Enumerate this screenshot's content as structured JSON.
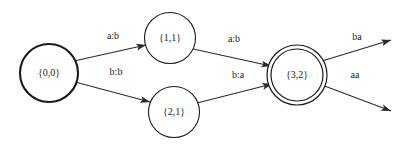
{
  "diagram": {
    "type": "finite-state-transducer",
    "title": "",
    "background_color": "#ffffff",
    "stroke_color": "#1a1a1a",
    "nodes": [
      {
        "id": "q00",
        "label": "{0,0}",
        "cx": 49,
        "cy": 73,
        "r": 29,
        "stroke_width": 2.1,
        "accepting": false,
        "start": true
      },
      {
        "id": "q11",
        "label": "{1,1}",
        "cx": 170,
        "cy": 38,
        "r": 25.5,
        "stroke_width": 1.1,
        "accepting": false,
        "start": false
      },
      {
        "id": "q21",
        "label": "{2,1}",
        "cx": 174,
        "cy": 112,
        "r": 25.5,
        "stroke_width": 1.1,
        "accepting": false,
        "start": false
      },
      {
        "id": "q32",
        "label": "{3,2}",
        "cx": 297,
        "cy": 75,
        "r": 30,
        "r_inner": 26,
        "stroke_width": 1.2,
        "accepting": true,
        "start": false
      }
    ],
    "edges": [
      {
        "id": "e1",
        "from": "q00",
        "to": "q11",
        "label": "a:b",
        "label_x": 113,
        "label_y": 37,
        "x1": 74,
        "y1": 61,
        "x2": 146,
        "y2": 45
      },
      {
        "id": "e2",
        "from": "q00",
        "to": "q21",
        "label": "b:b",
        "label_x": 116,
        "label_y": 73,
        "x1": 75,
        "y1": 82,
        "x2": 150,
        "y2": 102
      },
      {
        "id": "e3",
        "from": "q11",
        "to": "q32",
        "label": "a:b",
        "label_x": 234,
        "label_y": 40,
        "x1": 193,
        "y1": 49,
        "x2": 271,
        "y2": 66
      },
      {
        "id": "e4",
        "from": "q21",
        "to": "q32",
        "label": "b:a",
        "label_x": 238,
        "label_y": 76,
        "x1": 197,
        "y1": 103,
        "x2": 272,
        "y2": 84
      },
      {
        "id": "e5",
        "from": "q32",
        "to": null,
        "label": "ba",
        "label_x": 357,
        "label_y": 38,
        "x1": 322,
        "y1": 61,
        "x2": 391,
        "y2": 40
      },
      {
        "id": "e6",
        "from": "q32",
        "to": null,
        "label": "aa",
        "label_x": 355,
        "label_y": 76,
        "x1": 322,
        "y1": 85,
        "x2": 391,
        "y2": 111
      }
    ]
  }
}
